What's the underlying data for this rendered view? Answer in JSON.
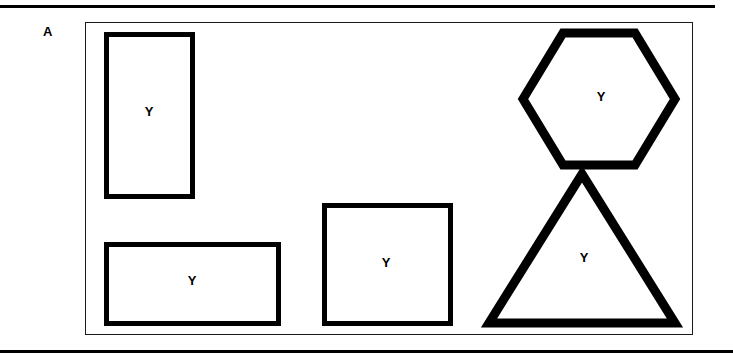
{
  "figure": {
    "panel_label": "A",
    "background_color": "#ffffff",
    "stroke_color": "#000000",
    "frame_color": "#1a1a1a",
    "rules": {
      "top_label": "top-horizontal-rule",
      "bottom_label": "bottom-horizontal-rule"
    },
    "shapes": [
      {
        "id": "tall-rectangle",
        "name": "tall vertical rectangle",
        "type": "rectangle",
        "letter": "Y",
        "stroke_width": 5
      },
      {
        "id": "wide-rectangle",
        "name": "wide horizontal rectangle",
        "type": "rectangle",
        "letter": "Y",
        "stroke_width": 5
      },
      {
        "id": "square-rectangle",
        "name": "near-square rectangle",
        "type": "rectangle",
        "letter": "Y",
        "stroke_width": 5
      },
      {
        "id": "hexagon",
        "name": "regular hexagon",
        "type": "hexagon",
        "letter": "Y",
        "stroke_width": 9
      },
      {
        "id": "triangle",
        "name": "isosceles triangle",
        "type": "triangle",
        "letter": "Y",
        "stroke_width": 9
      }
    ]
  }
}
